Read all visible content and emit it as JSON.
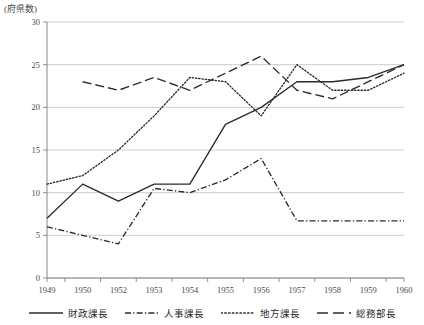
{
  "chart_data": {
    "type": "line",
    "title": "",
    "subtitle": "",
    "xlabel": "",
    "ylabel": "(府県数)",
    "ylim": [
      0,
      30
    ],
    "yticks": [
      0,
      5,
      10,
      15,
      20,
      25,
      30
    ],
    "grid": true,
    "legend_position": "bottom",
    "categories": [
      "1949",
      "1950",
      "1952",
      "1953",
      "1954",
      "1955",
      "1956",
      "1957",
      "1958",
      "1959",
      "1960"
    ],
    "x": [
      1949,
      1950,
      1952,
      1953,
      1954,
      1955,
      1956,
      1957,
      1958,
      1959,
      1960
    ],
    "series": [
      {
        "name": "財政課長",
        "style": "solid",
        "values": [
          7,
          11,
          9,
          11,
          11,
          18,
          20,
          23,
          23,
          23.5,
          25
        ]
      },
      {
        "name": "人事課長",
        "style": "dash-dot",
        "values": [
          6,
          5,
          4,
          10.5,
          10,
          11.5,
          14,
          6.7,
          6.7,
          6.7,
          6.7
        ]
      },
      {
        "name": "地方課長",
        "style": "dotted",
        "values": [
          11,
          12,
          15,
          19,
          23.5,
          23,
          19,
          25,
          22,
          22,
          24
        ]
      },
      {
        "name": "総務部長",
        "style": "long-dash",
        "values": [
          null,
          23,
          22,
          23.5,
          22,
          24,
          26,
          22,
          21,
          23,
          25
        ]
      }
    ]
  },
  "axis": {
    "y_title": "(府県数)",
    "y_tick_labels": [
      "0",
      "5",
      "10",
      "15",
      "20",
      "25",
      "30"
    ],
    "x_tick_labels": [
      "1949",
      "1950",
      "1952",
      "1953",
      "1954",
      "1955",
      "1956",
      "1957",
      "1958",
      "1959",
      "1960"
    ]
  },
  "legend": {
    "items": [
      {
        "label": "財政課長",
        "style": "solid"
      },
      {
        "label": "人事課長",
        "style": "dash-dot"
      },
      {
        "label": "地方課長",
        "style": "dotted"
      },
      {
        "label": "総務部長",
        "style": "long-dash"
      }
    ]
  },
  "colors": {
    "line": "#2b2b2b",
    "grid": "#b9b9b9",
    "axis": "#7a7a7a",
    "text": "#4a4a4a",
    "background": "#ffffff"
  }
}
